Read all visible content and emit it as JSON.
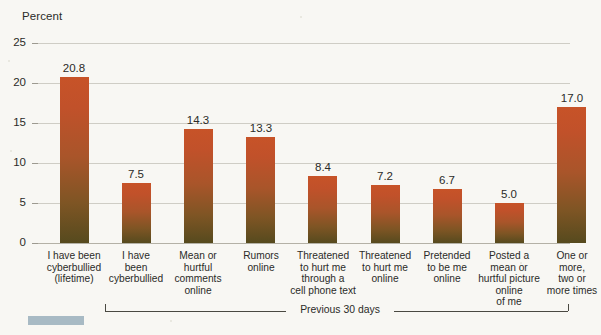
{
  "chart_data": {
    "type": "bar",
    "title": "",
    "xlabel": "",
    "ylabel": "Percent",
    "ylim": [
      0,
      25
    ],
    "yticks": [
      "0",
      "5",
      "10",
      "15",
      "20",
      "25"
    ],
    "grid": true,
    "legend": "none",
    "categories": [
      "I have been\ncyberbullied\n(lifetime)",
      "I have\nbeen\ncyberbullied",
      "Mean or\nhurtful\ncomments\nonline",
      "Rumors\nonline",
      "Threatened\nto hurt me\nthrough a\ncell phone text",
      "Threatened\nto hurt me\nonline",
      "Pretended\nto be me\nonline",
      "Posted a\nmean or\nhurtful picture\nonline\nof me",
      "One or\nmore,\ntwo or\nmore times"
    ],
    "values": [
      20.8,
      7.5,
      14.3,
      13.3,
      8.4,
      7.2,
      6.7,
      5.0,
      17.0
    ],
    "value_labels": [
      "20.8",
      "7.5",
      "14.3",
      "13.3",
      "8.4",
      "7.2",
      "6.7",
      "5.0",
      "17.0"
    ],
    "annotations": [
      {
        "name": "previous-30-days-bracket",
        "text": "Previous 30 days",
        "spans_categories": [
          1,
          8
        ]
      }
    ],
    "colors": {
      "bar_top": "#c75328",
      "bar_bottom": "#564a1e",
      "background": "#f8f7f3",
      "gridline": "#cfcdc5",
      "text": "#2b2b28",
      "bracket": "#4a4942",
      "corner_swatch": "#a8bac4"
    }
  }
}
